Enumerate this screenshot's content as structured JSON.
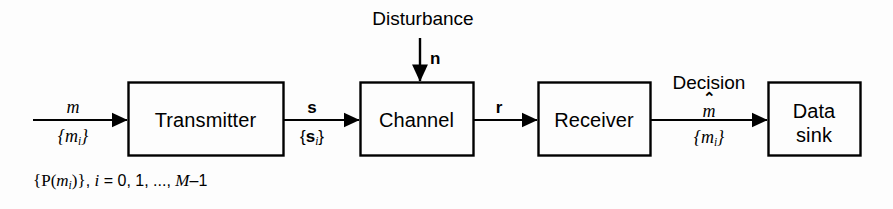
{
  "figure": {
    "type": "block-diagram",
    "background_color": "#fdfdfd",
    "stroke_color": "#000000"
  },
  "blocks": [
    {
      "id": "transmitter",
      "label": "Transmitter",
      "x": 128,
      "y": 82,
      "w": 155,
      "h": 73
    },
    {
      "id": "channel",
      "label": "Channel",
      "x": 360,
      "y": 82,
      "w": 113,
      "h": 73
    },
    {
      "id": "receiver",
      "label": "Receiver",
      "x": 538,
      "y": 82,
      "w": 112,
      "h": 73
    },
    {
      "id": "data-sink",
      "label_line1": "Data",
      "label_line2": "sink",
      "x": 768,
      "y": 82,
      "w": 92,
      "h": 73
    }
  ],
  "signals": {
    "input": {
      "above": "m",
      "below_open": "{",
      "below_base": "m",
      "below_sub": "i",
      "below_close": "}"
    },
    "transmitter_out": {
      "above": "s",
      "below_open": "{",
      "below_base": "s",
      "below_sub": "i",
      "below_close": "}"
    },
    "channel_out": {
      "above": "r"
    },
    "receiver_out": {
      "caption": "Decision",
      "hat_mark": "⌃",
      "hat_base": "m",
      "below_open": "{",
      "below_base": "m",
      "below_sub": "i",
      "below_close": "}"
    },
    "disturbance": {
      "caption": "Disturbance",
      "symbol": "n"
    }
  },
  "formula": {
    "open_brace": "{",
    "p": "P",
    "paren_open": "(",
    "m": "m",
    "sub": "i",
    "paren_close": ")",
    "close_brace": "}",
    "comma": ", ",
    "index": "i",
    "equals": " = ",
    "values": "0, 1, ..., ",
    "upper": "M",
    "minus_one": "–1"
  }
}
